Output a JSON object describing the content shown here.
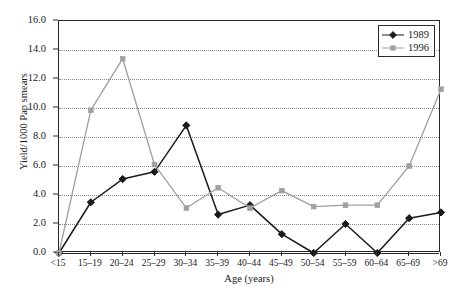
{
  "chart_data": {
    "type": "line",
    "title": "",
    "xlabel": "Age (years)",
    "ylabel": "Yield/1000 Pap smears",
    "categories": [
      "<15",
      "15–19",
      "20–24",
      "25–29",
      "30–34",
      "35–39",
      "40–44",
      "45–49",
      "50–54",
      "55–59",
      "60–64",
      "65–69",
      ">69"
    ],
    "ylim": [
      0.0,
      16.0
    ],
    "ytick_values": [
      0.0,
      2.0,
      4.0,
      6.0,
      8.0,
      10.0,
      12.0,
      14.0,
      16.0
    ],
    "ytick_labels": [
      "0.0",
      "2.0",
      "4.0",
      "6.0",
      "8.0",
      "10.0",
      "12.0",
      "14.0",
      "16.0"
    ],
    "grid": true,
    "grid_axis": "y",
    "grid_style": "dotted",
    "legend_position": "top-right",
    "series": [
      {
        "name": "1989",
        "color": "#1a1a1a",
        "marker": "diamond",
        "values": [
          0.0,
          3.5,
          5.1,
          5.6,
          8.8,
          2.65,
          3.3,
          1.3,
          0.0,
          2.0,
          0.0,
          2.4,
          2.8
        ]
      },
      {
        "name": "1996",
        "color": "#a0a0a0",
        "marker": "square",
        "values": [
          0.0,
          9.85,
          13.4,
          6.1,
          3.1,
          4.5,
          3.1,
          4.3,
          3.2,
          3.3,
          3.3,
          6.0,
          11.3
        ]
      }
    ]
  },
  "legend": {
    "entries": [
      {
        "label": "1989"
      },
      {
        "label": "1996"
      }
    ]
  },
  "colors": {
    "series_1989": "#1a1a1a",
    "series_1996": "#a0a0a0",
    "axis": "#2b2b2b",
    "grid": "#8c8c8c",
    "background": "#ffffff"
  }
}
